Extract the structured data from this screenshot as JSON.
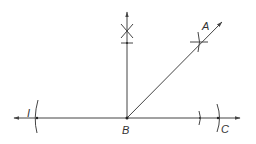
{
  "diagram": {
    "colors": {
      "line": "#444444",
      "label": "#333333",
      "background": "#ffffff"
    },
    "labels": {
      "A": "A",
      "B": "B",
      "C": "C",
      "I": "I"
    },
    "points": {
      "B": [
        127,
        118
      ],
      "A_arrow": [
        222,
        22
      ],
      "vertical_arrow": [
        127,
        12
      ],
      "left_arrow": [
        14,
        118
      ],
      "right_arrow": [
        240,
        118
      ]
    },
    "elements": [
      "horizontal line with arrows at both ends",
      "vertical ray from B upward",
      "diagonal ray from B through A",
      "construction arc near I",
      "construction arcs near C",
      "intersection mark on vertical ray",
      "intersection mark on diagonal ray"
    ]
  }
}
